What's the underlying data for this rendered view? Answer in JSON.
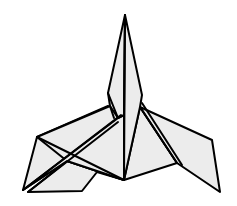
{
  "figure": {
    "title": "",
    "fill_color": "#ececec",
    "stroke_color": "#000000",
    "background": "#ffffff",
    "polygons": [
      {
        "name": "left-wing-back",
        "points": "37,137 108,106 112,120 67,161 23,190"
      },
      {
        "name": "left-lower-flap",
        "points": "67,161 124,180 97,172 82,191 28,192"
      },
      {
        "name": "left-body-panel",
        "points": "37,137 67,161 124,180 124,115 110,106"
      },
      {
        "name": "left-diagonal-flap",
        "points": "23,190 118,118 124,115 124,180 67,161"
      },
      {
        "name": "right-body-panel",
        "points": "124,180 140,107 177,163"
      },
      {
        "name": "right-wing",
        "points": "140,107 212,140 220,192 177,163"
      },
      {
        "name": "spike-left",
        "points": "125,15 108,93 110,106 118,118 124,115"
      },
      {
        "name": "spike-right",
        "points": "125,15 142,95 140,107 124,180 124,115"
      }
    ],
    "lines": [
      {
        "name": "center-crease",
        "x1": 125,
        "y1": 15,
        "x2": 124,
        "y2": 180
      },
      {
        "name": "left-cross-crease-a",
        "x1": 37,
        "y1": 137,
        "x2": 124,
        "y2": 180
      },
      {
        "name": "left-cross-crease-b",
        "x1": 23,
        "y1": 190,
        "x2": 121,
        "y2": 115
      },
      {
        "name": "left-cross-crease-c",
        "x1": 28,
        "y1": 192,
        "x2": 118,
        "y2": 122
      },
      {
        "name": "right-inner-crease",
        "x1": 140,
        "y1": 107,
        "x2": 177,
        "y2": 163
      },
      {
        "name": "right-inner-crease-b",
        "x1": 142,
        "y1": 103,
        "x2": 182,
        "y2": 165
      },
      {
        "name": "spike-base-left",
        "x1": 108,
        "y1": 93,
        "x2": 118,
        "y2": 118
      },
      {
        "name": "spike-base-left-b",
        "x1": 110,
        "y1": 106,
        "x2": 114,
        "y2": 118
      }
    ]
  }
}
